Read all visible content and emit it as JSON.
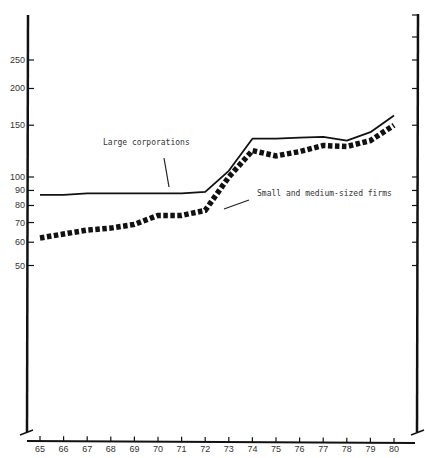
{
  "chart_data": {
    "type": "line",
    "title": "",
    "xlabel": "",
    "ylabel": "",
    "y_scale": "log",
    "grid": false,
    "legend": "none (inline annotations with arrows)",
    "x": [
      "65",
      "66",
      "67",
      "68",
      "69",
      "70",
      "71",
      "72",
      "73",
      "74",
      "75",
      "76",
      "77",
      "78",
      "79",
      "80"
    ],
    "y_ticks": [
      50,
      60,
      70,
      80,
      90,
      100,
      150,
      200,
      250
    ],
    "y_tick_labels": [
      "50",
      "60",
      "70",
      "80",
      "90",
      "100",
      "150",
      "200",
      "250"
    ],
    "series": [
      {
        "name": "Large corporations",
        "style": "solid",
        "values": [
          87,
          87,
          88,
          88,
          88,
          88,
          88,
          89,
          105,
          135,
          135,
          136,
          137,
          133,
          142,
          162
        ]
      },
      {
        "name": "Small and medium-sized firms",
        "style": "dotted-thick",
        "values": [
          62,
          64,
          66,
          67,
          69,
          74,
          74,
          77,
          100,
          123,
          118,
          122,
          128,
          127,
          133,
          150
        ]
      }
    ],
    "annotations": [
      {
        "text": "Large corporations",
        "points_to": "Large corporations"
      },
      {
        "text": "Small and medium-sized firms",
        "points_to": "Small and medium-sized firms"
      }
    ]
  }
}
